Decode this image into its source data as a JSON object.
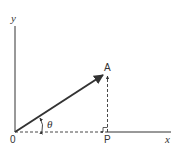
{
  "diagram": {
    "type": "vector-projection",
    "axes": {
      "x_label": "x",
      "y_label": "y",
      "origin_label": "0"
    },
    "points": {
      "A": "A",
      "P": "P"
    },
    "angle_label": "θ",
    "colors": {
      "stroke": "#333333",
      "background": "#ffffff"
    }
  }
}
